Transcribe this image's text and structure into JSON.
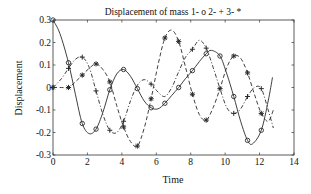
{
  "chart_data": {
    "type": "line",
    "title": "Displacement of mass 1- o  2- +  3- *",
    "xlabel": "Time",
    "ylabel": "Displacement",
    "xlim": [
      0,
      14
    ],
    "ylim": [
      -0.3,
      0.3
    ],
    "xticks": [
      0,
      2,
      4,
      6,
      8,
      10,
      12,
      14
    ],
    "xtick_labels": [
      "0",
      "2",
      "4",
      "6",
      "8",
      "10",
      "12",
      "14"
    ],
    "yticks": [
      0.3,
      0.2,
      0.1,
      0,
      -0.1,
      -0.2,
      -0.3
    ],
    "ytick_labels": [
      "0.3",
      "0.2",
      "0.1",
      "0",
      "-0.1",
      "-0.2",
      "-0.3"
    ],
    "grid": false,
    "legend": "none (encoded in title)",
    "series": [
      {
        "name": "mass 1",
        "marker": "o",
        "linestyle": "solid",
        "curve": [
          [
            0,
            0.3
          ],
          [
            0.4,
            0.24
          ],
          [
            0.9,
            0.11
          ],
          [
            1.3,
            -0.03
          ],
          [
            1.7,
            -0.16
          ],
          [
            2.1,
            -0.205
          ],
          [
            2.5,
            -0.185
          ],
          [
            2.9,
            -0.11
          ],
          [
            3.3,
            -0.01
          ],
          [
            3.7,
            0.06
          ],
          [
            4.1,
            0.08
          ],
          [
            4.5,
            0.05
          ],
          [
            4.9,
            -0.005
          ],
          [
            5.3,
            -0.06
          ],
          [
            5.7,
            -0.09
          ],
          [
            6.1,
            -0.095
          ],
          [
            6.5,
            -0.07
          ],
          [
            6.9,
            -0.035
          ],
          [
            7.3,
            0.0
          ],
          [
            7.7,
            0.04
          ],
          [
            8.1,
            0.075
          ],
          [
            8.5,
            0.115
          ],
          [
            8.9,
            0.15
          ],
          [
            9.2,
            0.165
          ],
          [
            9.7,
            0.14
          ],
          [
            10.1,
            0.06
          ],
          [
            10.5,
            -0.04
          ],
          [
            10.9,
            -0.15
          ],
          [
            11.3,
            -0.235
          ],
          [
            11.6,
            -0.25
          ],
          [
            12.1,
            -0.19
          ],
          [
            12.5,
            -0.06
          ],
          [
            12.75,
            0.045
          ]
        ],
        "markers": [
          [
            0,
            0.3
          ],
          [
            0.9,
            0.11
          ],
          [
            1.7,
            -0.16
          ],
          [
            2.5,
            -0.185
          ],
          [
            3.3,
            -0.01
          ],
          [
            4.1,
            0.08
          ],
          [
            4.9,
            -0.005
          ],
          [
            5.7,
            -0.09
          ],
          [
            6.5,
            -0.07
          ],
          [
            7.3,
            0.0
          ],
          [
            8.1,
            0.075
          ],
          [
            8.9,
            0.15
          ],
          [
            9.7,
            0.14
          ],
          [
            10.5,
            -0.04
          ],
          [
            11.3,
            -0.235
          ],
          [
            12.1,
            -0.19
          ]
        ]
      },
      {
        "name": "mass 2",
        "marker": "+",
        "linestyle": "dashdot",
        "curve": [
          [
            0,
            0.0
          ],
          [
            0.5,
            0.04
          ],
          [
            0.9,
            0.085
          ],
          [
            1.3,
            0.125
          ],
          [
            1.7,
            0.135
          ],
          [
            2.1,
            0.09
          ],
          [
            2.5,
            -0.015
          ],
          [
            2.9,
            -0.12
          ],
          [
            3.3,
            -0.19
          ],
          [
            3.7,
            -0.2
          ],
          [
            4.1,
            -0.15
          ],
          [
            4.5,
            -0.06
          ],
          [
            4.9,
            0.01
          ],
          [
            5.3,
            0.035
          ],
          [
            5.7,
            0.015
          ],
          [
            6.1,
            -0.02
          ],
          [
            6.5,
            -0.04
          ],
          [
            6.9,
            0.0
          ],
          [
            7.3,
            0.07
          ],
          [
            7.7,
            0.135
          ],
          [
            8.1,
            0.17
          ],
          [
            8.5,
            0.21
          ],
          [
            8.9,
            0.175
          ],
          [
            9.3,
            0.09
          ],
          [
            9.7,
            -0.005
          ],
          [
            10.1,
            -0.09
          ],
          [
            10.5,
            -0.115
          ],
          [
            10.9,
            -0.095
          ],
          [
            11.3,
            -0.04
          ],
          [
            11.7,
            0.0
          ],
          [
            12.1,
            -0.005
          ],
          [
            12.5,
            -0.1
          ],
          [
            12.8,
            -0.18
          ]
        ],
        "markers": [
          [
            0,
            0.0
          ],
          [
            0.9,
            0.085
          ],
          [
            1.7,
            0.135
          ],
          [
            2.5,
            -0.015
          ],
          [
            3.3,
            -0.19
          ],
          [
            4.1,
            -0.15
          ],
          [
            5.7,
            0.015
          ],
          [
            8.1,
            0.17
          ],
          [
            8.9,
            0.175
          ],
          [
            10.5,
            -0.115
          ],
          [
            11.3,
            -0.04
          ],
          [
            12.1,
            -0.005
          ]
        ]
      },
      {
        "name": "mass 3",
        "marker": "*",
        "linestyle": "dashed",
        "curve": [
          [
            0,
            0.0
          ],
          [
            0.5,
            0.0
          ],
          [
            0.9,
            0.0
          ],
          [
            1.3,
            0.025
          ],
          [
            1.7,
            0.055
          ],
          [
            2.1,
            0.085
          ],
          [
            2.5,
            0.105
          ],
          [
            2.9,
            0.08
          ],
          [
            3.3,
            0.025
          ],
          [
            3.7,
            -0.08
          ],
          [
            4.1,
            -0.175
          ],
          [
            4.5,
            -0.24
          ],
          [
            4.9,
            -0.26
          ],
          [
            5.3,
            -0.18
          ],
          [
            5.7,
            -0.05
          ],
          [
            6.1,
            0.1
          ],
          [
            6.5,
            0.22
          ],
          [
            6.9,
            0.255
          ],
          [
            7.3,
            0.205
          ],
          [
            7.7,
            0.09
          ],
          [
            8.1,
            -0.03
          ],
          [
            8.5,
            -0.12
          ],
          [
            8.9,
            -0.145
          ],
          [
            9.3,
            -0.09
          ],
          [
            9.7,
            -0.005
          ],
          [
            10.1,
            0.09
          ],
          [
            10.5,
            0.14
          ],
          [
            10.9,
            0.13
          ],
          [
            11.3,
            0.065
          ],
          [
            11.7,
            -0.03
          ],
          [
            12.1,
            -0.115
          ],
          [
            12.5,
            -0.15
          ],
          [
            12.8,
            -0.1
          ]
        ],
        "markers": [
          [
            0,
            0.0
          ],
          [
            0.9,
            0.0
          ],
          [
            1.7,
            0.055
          ],
          [
            2.5,
            0.105
          ],
          [
            3.3,
            0.025
          ],
          [
            4.1,
            -0.175
          ],
          [
            4.9,
            -0.26
          ],
          [
            5.7,
            -0.05
          ],
          [
            6.5,
            0.22
          ],
          [
            7.3,
            0.205
          ],
          [
            8.1,
            -0.03
          ],
          [
            8.9,
            -0.145
          ],
          [
            9.7,
            -0.005
          ],
          [
            10.5,
            0.14
          ],
          [
            11.3,
            0.065
          ],
          [
            12.1,
            -0.115
          ]
        ]
      }
    ]
  },
  "layout": {
    "plot": {
      "left": 53,
      "top": 20,
      "right": 294,
      "bottom": 155
    },
    "colors": {
      "line": "#2a2a2a",
      "axis": "#333333",
      "background": "#ffffff"
    }
  }
}
